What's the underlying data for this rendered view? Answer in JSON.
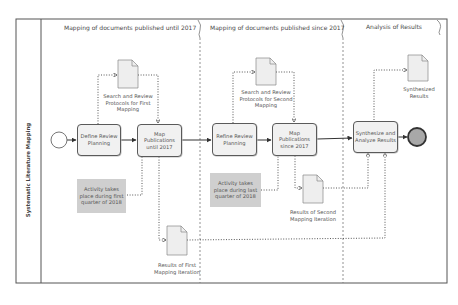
{
  "diagram": {
    "type": "BPMN process",
    "pool": {
      "label": "Systematic Literature Mapping"
    },
    "phases": [
      {
        "id": "phase1",
        "label": "Mapping of documents published until 2017"
      },
      {
        "id": "phase2",
        "label": "Mapping of documents published since 2017"
      },
      {
        "id": "phase3",
        "label": "Analysis of Results"
      }
    ],
    "events": {
      "start": {
        "label": "",
        "type": "start-event"
      },
      "end": {
        "label": "",
        "type": "end-event",
        "fill": "#a8a8a8"
      }
    },
    "tasks": [
      {
        "id": "t1",
        "label": "Define Review Planning"
      },
      {
        "id": "t2",
        "label": "Map Publications until 2017"
      },
      {
        "id": "t3",
        "label": "Refine Review Planning"
      },
      {
        "id": "t4",
        "label": "Map Publications since 2017"
      },
      {
        "id": "t5",
        "label": "Synthesize and Analyze Results"
      }
    ],
    "documents": [
      {
        "id": "d1",
        "label": "Search and Review Protocols for First Mapping"
      },
      {
        "id": "d2",
        "label": "Search and Review Protocols for Second Mapping"
      },
      {
        "id": "d3",
        "label": "Synthesized Results"
      },
      {
        "id": "d4",
        "label": "Results of Second Mapping Iteration"
      },
      {
        "id": "d5",
        "label": "Results of First Mapping Iteration"
      }
    ],
    "annotations": [
      {
        "id": "n1",
        "label": "Activity takes place during first quarter of 2018"
      },
      {
        "id": "n2",
        "label": "Activity takes place during last quarter of 2018"
      }
    ],
    "sequence_flows": [
      [
        "start",
        "t1"
      ],
      [
        "t1",
        "t2"
      ],
      [
        "t2",
        "t3"
      ],
      [
        "t3",
        "t4"
      ],
      [
        "t4",
        "t5"
      ],
      [
        "t5",
        "end"
      ]
    ],
    "data_associations": [
      [
        "t1",
        "d1"
      ],
      [
        "d1",
        "t2"
      ],
      [
        "t3",
        "d2"
      ],
      [
        "d2",
        "t4"
      ],
      [
        "t2",
        "d5"
      ],
      [
        "d5",
        "t5"
      ],
      [
        "t4",
        "d4"
      ],
      [
        "d4",
        "t5"
      ],
      [
        "t5",
        "d3"
      ]
    ],
    "colors": {
      "line": "#4a4a4a",
      "task_fill": "#f1f1f1",
      "document_fill": "#eeeeee",
      "note_fill": "#cfcfcf",
      "end_event_fill": "#a8a8a8"
    }
  }
}
